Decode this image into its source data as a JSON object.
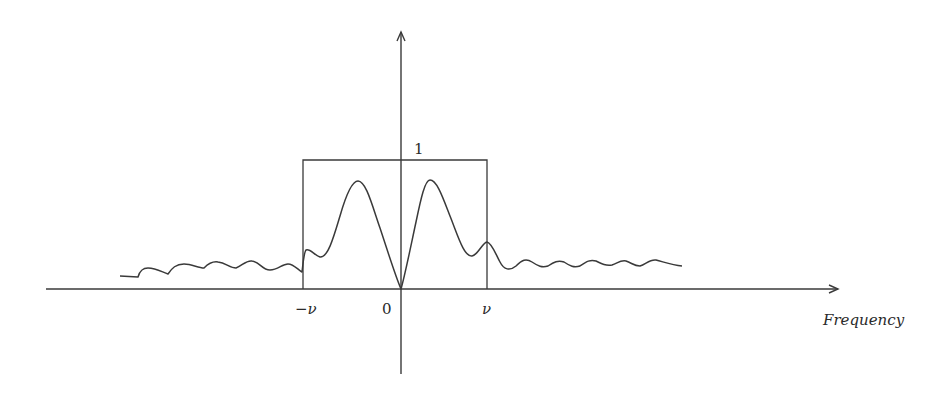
{
  "figure": {
    "type": "frequency-response-diagram",
    "axes": {
      "x_axis_label": "Frequency",
      "y_tick_label": "1",
      "x_tick_labels": {
        "neg_nu": "−ν",
        "zero": "0",
        "pos_nu": "ν"
      }
    },
    "elements": [
      {
        "name": "ideal-bandpass-rectangle",
        "description": "Ideal filter of height 1 spanning from -ν to ν"
      },
      {
        "name": "actual-response-curve",
        "description": "Response curve that is zero at the origin, peaks on either side inside the passband, and ripples outside it"
      }
    ],
    "colors": {
      "stroke": "#3a3a3a",
      "background": "#ffffff"
    }
  }
}
